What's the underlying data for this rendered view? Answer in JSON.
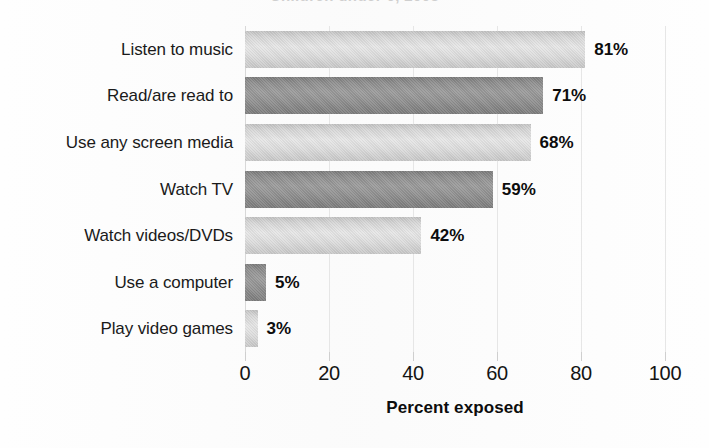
{
  "figure": {
    "title_fragment": "Children under 6, 2003",
    "background_color": "#fefefe"
  },
  "chart_data": {
    "type": "bar",
    "orientation": "horizontal",
    "title": "",
    "subtitle": "",
    "xlabel": "Percent exposed",
    "ylabel": "",
    "categories": [
      "Listen to music",
      "Read/are read to",
      "Use any screen media",
      "Watch TV",
      "Watch videos/DVDs",
      "Use a computer",
      "Play video games"
    ],
    "values": [
      81,
      71,
      68,
      59,
      42,
      5,
      3
    ],
    "value_labels": [
      "81%",
      "71%",
      "68%",
      "59%",
      "42%",
      "5%",
      "3%"
    ],
    "bar_styles": [
      "light",
      "dark",
      "light",
      "dark",
      "light",
      "dark",
      "light"
    ],
    "xlim": [
      0,
      100
    ],
    "xticks": [
      0,
      20,
      40,
      60,
      80,
      100
    ],
    "xtick_labels": [
      "0",
      "20",
      "40",
      "60",
      "80",
      "100"
    ],
    "grid": true,
    "grid_axis": "x",
    "legend": null,
    "colors": {
      "bar_light": "#dcdcdc",
      "bar_dark": "#8f8f8f",
      "gridline": "#e6e6e6",
      "text": "#111111",
      "background": "#fefefe"
    }
  }
}
